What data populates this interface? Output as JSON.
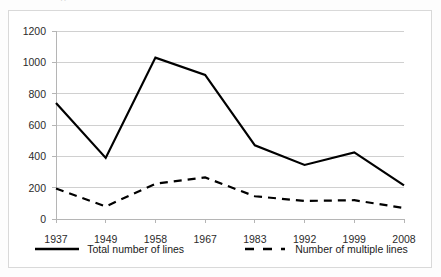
{
  "top_fragment": "··",
  "chart_data": {
    "type": "line",
    "title": "",
    "subtitle": "",
    "xlabel": "",
    "ylabel": "",
    "categories": [
      "1937",
      "1949",
      "1958",
      "1967",
      "1983",
      "1992",
      "1999",
      "2008"
    ],
    "x": [
      1937,
      1949,
      1958,
      1967,
      1983,
      1992,
      1999,
      2008
    ],
    "ylim": [
      0,
      1200
    ],
    "yticks": [
      0,
      200,
      400,
      600,
      800,
      1000,
      1200
    ],
    "ytick_labels": [
      "0",
      "200",
      "400",
      "600",
      "800",
      "1000",
      "1200"
    ],
    "grid": true,
    "grid_axis": "y",
    "legend_position": "bottom",
    "series": [
      {
        "name": "Total number of lines",
        "style": "solid",
        "color": "#000000",
        "width": 2.2,
        "values": [
          740,
          390,
          1030,
          920,
          470,
          345,
          425,
          215
        ]
      },
      {
        "name": "Number of multiple lines",
        "style": "dashed",
        "color": "#000000",
        "width": 2.2,
        "values": [
          195,
          80,
          225,
          265,
          145,
          115,
          120,
          70
        ]
      }
    ]
  },
  "legend": {
    "items": [
      {
        "label": "Total number of lines",
        "style": "solid"
      },
      {
        "label": "Number of multiple lines",
        "style": "dashed"
      }
    ]
  },
  "colors": {
    "line": "#000000",
    "grid": "#d0d0d0",
    "axis": "#b5b5b5",
    "frame": "#d9d9d9",
    "background": "#ffffff",
    "text": "#1a1a1a"
  }
}
